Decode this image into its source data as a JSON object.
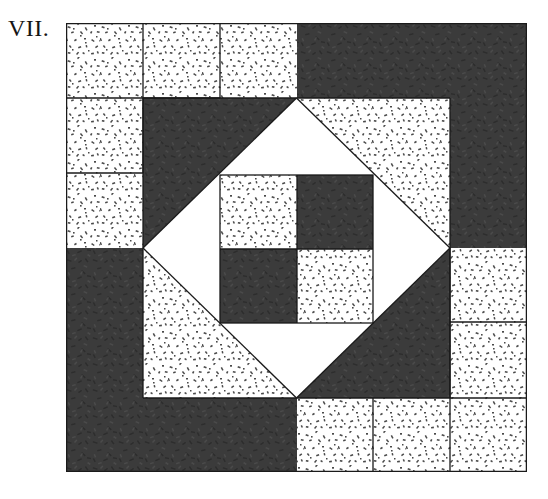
{
  "figure": {
    "plate_label": "VII.",
    "caption": "",
    "type": "quilt-block-diagram"
  },
  "block": {
    "name": "pieced quilt block",
    "grid_columns": 6,
    "grid_rows": 6,
    "origin_x": 66,
    "origin_y": 23,
    "width": 461,
    "height": 449,
    "outline_color": "#1a1a1a",
    "seam_line_color": "#1a1a1a",
    "seam_line_width": 1.2
  },
  "fabrics": [
    {
      "key": "dark",
      "label": "dark solid",
      "color": "#3a3a3a",
      "texture": "solid-dark"
    },
    {
      "key": "light",
      "label": "light print",
      "color": "#ffffff",
      "texture": "speckled-print"
    },
    {
      "key": "plain",
      "label": "plain white",
      "color": "#ffffff",
      "texture": "none"
    }
  ],
  "legend": {
    "dark_swatch_label": "dark",
    "light_swatch_label": "print",
    "plain_swatch_label": "plain"
  },
  "pieces": [
    {
      "id": "corner-tl-a",
      "row": 0,
      "col": 0,
      "shape": "square",
      "fabric": "light"
    },
    {
      "id": "corner-tl-b",
      "row": 0,
      "col": 1,
      "shape": "square",
      "fabric": "light"
    },
    {
      "id": "corner-tl-c",
      "row": 1,
      "col": 0,
      "shape": "square",
      "fabric": "light"
    },
    {
      "id": "top-bar",
      "row": 0,
      "col": 2,
      "shape": "rect-2x1",
      "fabric": "light"
    },
    {
      "id": "top-right",
      "row": 0,
      "col": 4,
      "shape": "rect-2x1",
      "fabric": "dark"
    },
    {
      "id": "right-bar",
      "row": 1,
      "col": 5,
      "shape": "rect-1x2",
      "fabric": "dark"
    },
    {
      "id": "corner-tr-a",
      "row": 1,
      "col": 4,
      "shape": "square",
      "fabric": "light"
    },
    {
      "id": "left-bar",
      "row": 2,
      "col": 0,
      "shape": "rect-1x2",
      "fabric": "dark"
    },
    {
      "id": "corner-br-a",
      "row": 4,
      "col": 5,
      "shape": "square",
      "fabric": "light"
    },
    {
      "id": "corner-br-b",
      "row": 5,
      "col": 5,
      "shape": "square",
      "fabric": "light"
    },
    {
      "id": "corner-br-c",
      "row": 5,
      "col": 4,
      "shape": "square",
      "fabric": "light"
    },
    {
      "id": "bottom-bar",
      "row": 5,
      "col": 0,
      "shape": "rect-2x1",
      "fabric": "dark"
    },
    {
      "id": "bottom-print",
      "row": 5,
      "col": 2,
      "shape": "rect-2x1",
      "fabric": "light"
    },
    {
      "id": "hst-tl",
      "row": 1,
      "col": 1,
      "shape": "half-square-triangle",
      "fabric_a": "dark",
      "fabric_b": "plain",
      "orientation": "nw-dark"
    },
    {
      "id": "hst-tr",
      "row": 1,
      "col": 3,
      "shape": "half-square-triangle",
      "fabric_a": "light",
      "fabric_b": "plain",
      "orientation": "ne-light"
    },
    {
      "id": "hst-bl",
      "row": 3,
      "col": 1,
      "shape": "half-square-triangle",
      "fabric_a": "light",
      "fabric_b": "plain",
      "orientation": "sw-light"
    },
    {
      "id": "hst-br",
      "row": 3,
      "col": 3,
      "shape": "half-square-triangle",
      "fabric_a": "dark",
      "fabric_b": "plain",
      "orientation": "se-dark"
    },
    {
      "id": "center-tl",
      "row": 2,
      "col": 2,
      "shape": "square",
      "fabric": "light"
    },
    {
      "id": "center-tr",
      "row": 2,
      "col": 3,
      "shape": "square",
      "fabric": "dark"
    },
    {
      "id": "center-bl",
      "row": 3,
      "col": 2,
      "shape": "square",
      "fabric": "dark"
    },
    {
      "id": "center-br",
      "row": 3,
      "col": 3,
      "shape": "square",
      "fabric": "light"
    }
  ],
  "center_four_patch": {
    "label": "center four-patch",
    "cells": [
      "light",
      "dark",
      "dark",
      "light"
    ],
    "x": 220,
    "y": 175,
    "size": 152
  },
  "inner_diamond": {
    "label": "square-in-a-square diamond",
    "fabric": "plain",
    "points": "on-point square set inside the middle ring"
  }
}
